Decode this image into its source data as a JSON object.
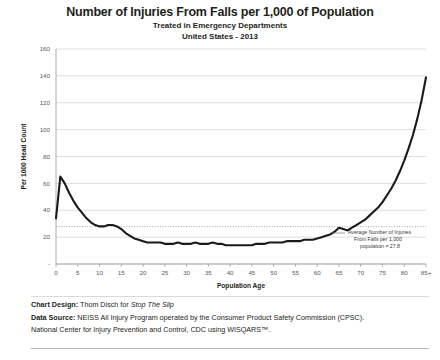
{
  "header": {
    "title": "Number of Injuries From Falls per 1,000 of Population",
    "subtitle1": "Treated in Emergency Departments",
    "subtitle2": "United States - 2013"
  },
  "annotation": {
    "line1": "Average  Number of Injuries",
    "line2": "From Falls per  1,000",
    "line3": "population = 27.8"
  },
  "footer": {
    "design_label": "Chart Design:",
    "design_value": " Thom Disch for ",
    "design_italic": "Stop The Slip",
    "source_label": "Data Source:",
    "source_value": " NEISS All Injury Program operated by the Consumer Product Safety Commission (CPSC).",
    "source_line2": "National Center for Injury Prevention and Control, CDC using WISQARS™."
  },
  "colors": {
    "line": "#1a1a1a",
    "grid": "#d0d0d0",
    "axis": "#9a9a9a",
    "average_line": "#8c8c8c",
    "text": "#231f20"
  },
  "chart_data": {
    "type": "line",
    "title": "Number of Injuries From Falls per 1,000 of Population",
    "subtitle": "Treated in Emergency Departments / United States - 2013",
    "xlabel": "Population Age",
    "ylabel": "Per 1000 Head Count",
    "ylim": [
      0,
      160
    ],
    "yticks": [
      0,
      20,
      40,
      60,
      80,
      100,
      120,
      140,
      160
    ],
    "ytick_labels": [
      "-",
      "20",
      "40",
      "60",
      "80",
      "100",
      "120",
      "140",
      "160"
    ],
    "xlim": [
      0,
      85
    ],
    "xticks": [
      0,
      5,
      10,
      15,
      20,
      25,
      30,
      35,
      40,
      45,
      50,
      55,
      60,
      65,
      70,
      75,
      80,
      85
    ],
    "xtick_labels": [
      "0",
      "5",
      "10",
      "15",
      "20",
      "25",
      "30",
      "35",
      "40",
      "45",
      "50",
      "55",
      "60",
      "65",
      "70",
      "75",
      "80",
      "85+"
    ],
    "grid": true,
    "legend": false,
    "average_value": 27.8,
    "average_label": "Average Number of Injuries From Falls per 1,000 population = 27.8",
    "x": [
      0,
      1,
      2,
      3,
      4,
      5,
      6,
      7,
      8,
      9,
      10,
      11,
      12,
      13,
      14,
      15,
      16,
      17,
      18,
      19,
      20,
      21,
      22,
      23,
      24,
      25,
      26,
      27,
      28,
      29,
      30,
      31,
      32,
      33,
      34,
      35,
      36,
      37,
      38,
      39,
      40,
      41,
      42,
      43,
      44,
      45,
      46,
      47,
      48,
      49,
      50,
      51,
      52,
      53,
      54,
      55,
      56,
      57,
      58,
      59,
      60,
      61,
      62,
      63,
      64,
      65,
      66,
      67,
      68,
      69,
      70,
      71,
      72,
      73,
      74,
      75,
      76,
      77,
      78,
      79,
      80,
      81,
      82,
      83,
      84,
      85
    ],
    "values": [
      34,
      65,
      60,
      53,
      47,
      42,
      38,
      34,
      31,
      29,
      28,
      28,
      29,
      29,
      28,
      26,
      23,
      21,
      19,
      18,
      17,
      16,
      16,
      16,
      16,
      15,
      15,
      15,
      16,
      15,
      15,
      15,
      16,
      15,
      15,
      15,
      16,
      15,
      15,
      14,
      14,
      14,
      14,
      14,
      14,
      14,
      15,
      15,
      15,
      16,
      16,
      16,
      16,
      17,
      17,
      17,
      17,
      18,
      18,
      18,
      19,
      20,
      21,
      22,
      24,
      27,
      26,
      25,
      27,
      29,
      31,
      33,
      36,
      39,
      42,
      46,
      51,
      56,
      62,
      69,
      77,
      86,
      96,
      108,
      122,
      139
    ],
    "series_name": "Injuries from falls per 1,000 population"
  }
}
